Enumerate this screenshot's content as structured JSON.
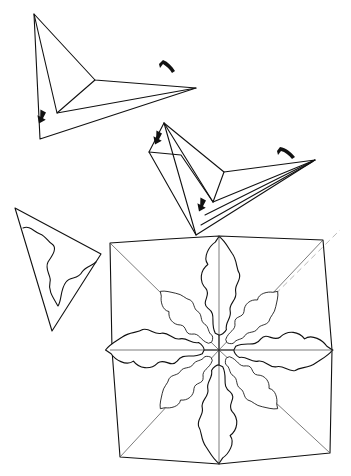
{
  "figure": {
    "steps": [
      {
        "id": "step-fold-1",
        "label": "Fold triangle, arrows indicate folding directions",
        "arrows": 2
      },
      {
        "id": "step-fold-2",
        "label": "Further folded triangle, arrows indicate folding directions",
        "arrows": 3
      },
      {
        "id": "step-cut",
        "label": "Folded wedge with wavy cut line"
      },
      {
        "id": "step-result",
        "label": "Unfolded square showing eight-petal snowflake cut-out",
        "petals": 8
      }
    ],
    "colors": {
      "line": "#111111",
      "background": "#ffffff",
      "guide": "#999999"
    }
  }
}
